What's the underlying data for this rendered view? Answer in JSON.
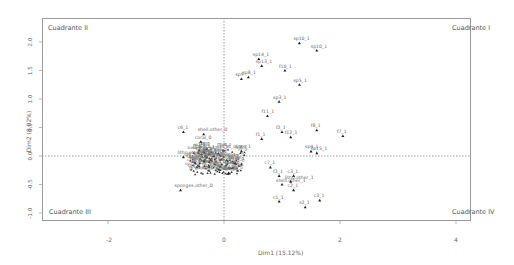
{
  "chart_data": {
    "type": "scatter",
    "title": "",
    "xlabel": "Dim1 (15.12%)",
    "ylabel": "Dim2 (8.02%)",
    "xlim": [
      -3.0,
      4.3
    ],
    "ylim": [
      -1.3,
      2.4
    ],
    "x_ticks": [
      "-2",
      "0",
      "2",
      "4"
    ],
    "y_ticks": [
      "-1.0",
      "-0.5",
      "0.0",
      "0.5",
      "1.0",
      "1.5",
      "2.0"
    ],
    "grid": false,
    "reference_lines": {
      "x": 0,
      "y": 0,
      "style": "dotted"
    },
    "quadrant_labels": {
      "top_left": "Cuadrante II",
      "top_right": "Cuadrante I",
      "bottom_left": "Cuadrante III",
      "bottom_right": "Cuadrante IV"
    },
    "points": [
      {
        "label": "sp10_1",
        "x": 1.3,
        "y": 1.98
      },
      {
        "label": "sp10_1",
        "x": 1.6,
        "y": 1.85
      },
      {
        "label": "sp14_1",
        "x": 0.6,
        "y": 1.7
      },
      {
        "label": "sp13_1",
        "x": 0.65,
        "y": 1.58
      },
      {
        "label": "f10_1",
        "x": 1.05,
        "y": 1.5
      },
      {
        "label": "sp9",
        "x": 0.3,
        "y": 1.35
      },
      {
        "label": "sp8_1",
        "x": 0.42,
        "y": 1.38
      },
      {
        "label": "sp5_1",
        "x": 1.3,
        "y": 1.25
      },
      {
        "label": "sp3_1",
        "x": 0.95,
        "y": 0.95
      },
      {
        "label": "f11_1",
        "x": 0.75,
        "y": 0.7
      },
      {
        "label": "f2_1",
        "x": 1.0,
        "y": 0.42
      },
      {
        "label": "f12_1",
        "x": 1.15,
        "y": 0.33
      },
      {
        "label": "f8_1",
        "x": 1.6,
        "y": 0.45
      },
      {
        "label": "f7_1",
        "x": 2.05,
        "y": 0.35
      },
      {
        "label": "f1_1",
        "x": 0.65,
        "y": 0.3
      },
      {
        "label": "sp4_1",
        "x": 1.5,
        "y": 0.08
      },
      {
        "label": "sp15_1",
        "x": 1.6,
        "y": 0.05
      },
      {
        "label": "c6_1",
        "x": -0.7,
        "y": 0.42
      },
      {
        "label": "shell.other_0",
        "x": -0.35,
        "y": 0.38
      },
      {
        "label": "coral_0",
        "x": -0.4,
        "y": 0.25
      },
      {
        "label": "litho.other_0",
        "x": -0.7,
        "y": -0.02
      },
      {
        "label": "bare_1",
        "x": 0.3,
        "y": 0.08
      },
      {
        "label": "sp7_1",
        "x": 0.08,
        "y": -0.3
      },
      {
        "label": "c7_1",
        "x": 0.8,
        "y": -0.2
      },
      {
        "label": "f2_1",
        "x": 0.95,
        "y": -0.35
      },
      {
        "label": "c3_1",
        "x": 1.2,
        "y": -0.35
      },
      {
        "label": "shell.other_1",
        "x": 1.0,
        "y": -0.5
      },
      {
        "label": "litho.other_1",
        "x": 1.15,
        "y": -0.45
      },
      {
        "label": "c2_1",
        "x": 1.2,
        "y": -0.6
      },
      {
        "label": "c1_1",
        "x": 0.95,
        "y": -0.8
      },
      {
        "label": "c3_1",
        "x": 1.65,
        "y": -0.78
      },
      {
        "label": "s2_1",
        "x": 1.4,
        "y": -0.9
      },
      {
        "label": "sponges.other_0",
        "x": -0.75,
        "y": -0.6
      }
    ],
    "marker": "triangle",
    "marker_color": "#222222"
  }
}
